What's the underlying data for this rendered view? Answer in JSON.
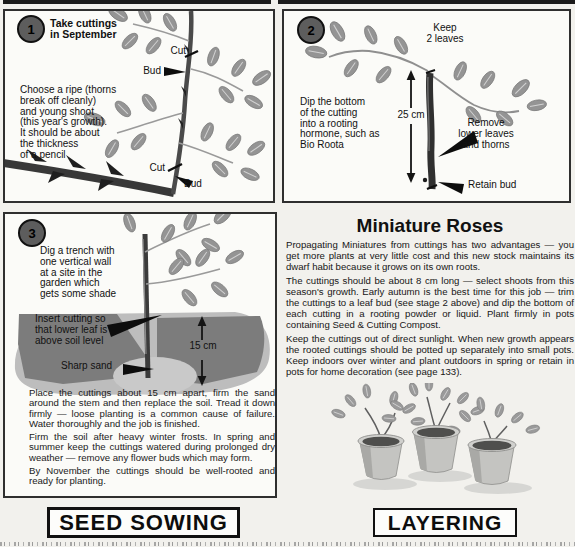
{
  "colors": {
    "page_bg": "#f2f1ed",
    "panel_bg": "#fbfbf8",
    "panel_border": "#2f2f2f",
    "top_bar": "#1b1b1b",
    "leaf_gray": "#949494",
    "soil_dark": "#7c7c7c",
    "soil_light": "#bdbdbd",
    "sand": "#c9c9c9",
    "step_circle": "#5d5d5d"
  },
  "steps": [
    {
      "number": "1",
      "title": "Take cuttings\nin September",
      "body": "Choose a ripe (thorns\nbreak off cleanly)\nand young shoot\n(this year's growth).\nIt should be about\nthe thickness\nof a pencil",
      "labels": {
        "cut_top": "Cut",
        "bud_top": "Bud",
        "cut_bottom": "Cut",
        "bud_bottom": "Bud"
      }
    },
    {
      "number": "2",
      "keep": "Keep\n2 leaves",
      "body": "Dip the bottom\nof the cutting\ninto a rooting\nhormone, such as\nBio Roota",
      "measure": "25 cm",
      "remove": "Remove\nlower leaves\nand thorns",
      "retain": "Retain bud"
    },
    {
      "number": "3",
      "dig": "Dig a trench with\none vertical wall\nat a site in the\ngarden which\ngets some shade",
      "insert": "Insert cutting so\nthat lower leaf is\nabove soil level",
      "sand": "Sharp sand",
      "measure": "15 cm",
      "paragraphs": [
        "Place the cuttings about 15 cm apart, firm the sand around the stem and then replace the soil. Tread it down firmly — loose planting is a common cause of failure. Water thoroughly and the job is finished.",
        "Firm the soil after heavy winter frosts. In spring and summer keep the cuttings watered during prolonged dry weather — remove any flower buds which may form.",
        "By November the cuttings should be well-rooted and ready for planting."
      ]
    }
  ],
  "miniature": {
    "title": "Miniature Roses",
    "paragraphs": [
      "Propagating Miniatures from cuttings has two advantages — you get more plants at very little cost and this new stock maintains its dwarf habit because it grows on its own roots.",
      "The cuttings should be about 8 cm long — select shoots from this season's growth. Early autumn is the best time for this job — trim the cuttings to a leaf bud (see stage 2 above) and dip the bottom of each cutting in a rooting powder or liquid. Plant firmly in pots containing Seed & Cutting Compost.",
      "Keep the cuttings out of direct sunlight. When new growth appears the rooted cuttings should be potted up separately into small pots. Keep indoors over winter and plant outdoors in spring or retain in pots for home decoration (see page 133)."
    ]
  },
  "footer": {
    "left": "SEED SOWING",
    "right": "LAYERING"
  }
}
